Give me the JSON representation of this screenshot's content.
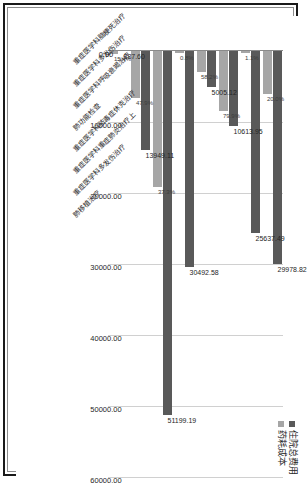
{
  "chart_data": {
    "type": "bar",
    "orientation": "horizontal",
    "title": "",
    "xlabel": "",
    "ylabel": "",
    "ylim": [
      0,
      60000
    ],
    "grid": true,
    "legend_position": "top-right",
    "tick_labels": [
      "0.00",
      "10000.00",
      "20000.00",
      "30000.00",
      "40000.00",
      "50000.00",
      "60000.00"
    ],
    "tick_values": [
      0,
      10000,
      20000,
      30000,
      40000,
      50000,
      60000
    ],
    "legend": [
      {
        "name": "住院总费用",
        "color": "#595959"
      },
      {
        "name": "药耗成本",
        "color": "#a6a6a6"
      }
    ],
    "categories": [
      "重症医学科脑梗死治疗",
      "重症医学科多发伤治疗",
      "重症医学科呼吸衰竭治疗",
      "肺功能检查",
      "重症医学科脓毒症休克治疗",
      "重症医学科重症肺炎治疗上",
      "重症医学科多发伤治疗",
      "肺移植治疗"
    ],
    "series": [
      {
        "name": "住院总费用",
        "color": "#595959",
        "values": [
          29978.82,
          25637.49,
          10613.95,
          5005.12,
          30492.58,
          51199.19,
          13949.11,
          0
        ]
      },
      {
        "name": "药耗成本",
        "color": "#a6a6a6",
        "values": [
          5995.76,
          282.01,
          8480.55,
          2912.98,
          243.94,
          19097.3,
          6681.62,
          387.6
        ]
      }
    ],
    "value_labels": [
      "29978.82",
      "25637.49",
      "10613.95",
      "5005.12",
      "30492.58",
      "51199.19",
      "13949.11",
      "387.60"
    ],
    "percent_labels": [
      "20.0%",
      "1.1%",
      "79.9%",
      "58.2%",
      "0.8%",
      "37.3%",
      "47.9%",
      "15.4%"
    ]
  }
}
